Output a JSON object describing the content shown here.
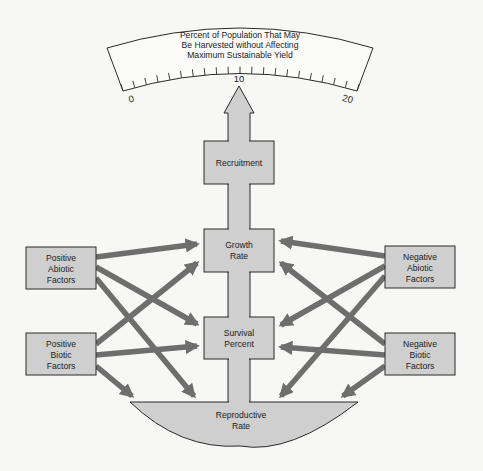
{
  "colors": {
    "background": "#f7f7f5",
    "box_fill": "#cfcfcf",
    "box_stroke": "#3a3a3a",
    "arrow": "#6e6e6e",
    "text": "#1c1c1c"
  },
  "gauge": {
    "title_lines": [
      "Percent of Population That May",
      "Be Harvested without Affecting",
      "Maximum Sustainable Yield"
    ],
    "min_label": "0",
    "mid_label": "10",
    "max_label": "20",
    "pointer_value": "10"
  },
  "nodes": {
    "recruitment": {
      "lines": [
        "Recruitment"
      ]
    },
    "growth_rate": {
      "lines": [
        "Growth",
        "Rate"
      ]
    },
    "survival_percent": {
      "lines": [
        "Survival",
        "Percent"
      ]
    },
    "reproductive_rate": {
      "lines": [
        "Reproductive",
        "Rate"
      ]
    },
    "positive_abiotic": {
      "lines": [
        "Positive",
        "Abiotic",
        "Factors"
      ]
    },
    "positive_biotic": {
      "lines": [
        "Positive",
        "Biotic",
        "Factors"
      ]
    },
    "negative_abiotic": {
      "lines": [
        "Negative",
        "Abiotic",
        "Factors"
      ]
    },
    "negative_biotic": {
      "lines": [
        "Negative",
        "Biotic",
        "Factors"
      ]
    }
  },
  "edges": [
    {
      "from": "Positive Abiotic Factors",
      "to": "Growth Rate"
    },
    {
      "from": "Positive Abiotic Factors",
      "to": "Survival Percent"
    },
    {
      "from": "Positive Abiotic Factors",
      "to": "Reproductive Rate"
    },
    {
      "from": "Positive Biotic Factors",
      "to": "Growth Rate"
    },
    {
      "from": "Positive Biotic Factors",
      "to": "Survival Percent"
    },
    {
      "from": "Positive Biotic Factors",
      "to": "Reproductive Rate"
    },
    {
      "from": "Negative Abiotic Factors",
      "to": "Growth Rate"
    },
    {
      "from": "Negative Abiotic Factors",
      "to": "Survival Percent"
    },
    {
      "from": "Negative Abiotic Factors",
      "to": "Reproductive Rate"
    },
    {
      "from": "Negative Biotic Factors",
      "to": "Growth Rate"
    },
    {
      "from": "Negative Biotic Factors",
      "to": "Survival Percent"
    },
    {
      "from": "Negative Biotic Factors",
      "to": "Reproductive Rate"
    },
    {
      "from": "Reproductive Rate",
      "to": "Survival Percent"
    },
    {
      "from": "Survival Percent",
      "to": "Growth Rate"
    },
    {
      "from": "Growth Rate",
      "to": "Recruitment"
    },
    {
      "from": "Recruitment",
      "to": "Gauge (10)"
    }
  ]
}
